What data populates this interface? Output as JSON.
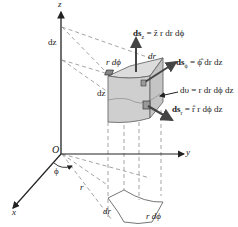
{
  "diagram": {
    "axes": {
      "z_label": "z",
      "y_label": "y",
      "x_label": "x",
      "origin_label": "O",
      "phi_label": "ϕ",
      "r_label": "r"
    },
    "labels": {
      "dz_axis": "dz",
      "dz_cube": "dz",
      "r_dphi_top": "r dϕ",
      "dr_top": "dr",
      "dr_base": "dr",
      "r_dphi_base": "r dϕ"
    },
    "equations": {
      "ds_z": "ds_z = ẑ r dr dϕ",
      "ds_phi": "ds_ϕ = ϕ̂ dr dz",
      "dv": "dυ = r dr dϕ dz",
      "ds_r": "ds_r = r̂ r dϕ dz"
    },
    "equation_parts": {
      "ds_z_lhs": "ds",
      "ds_z_sub": "z",
      "ds_z_rhs": " = ẑ r dr dϕ",
      "ds_phi_lhs": "ds",
      "ds_phi_sub": "ϕ",
      "ds_phi_rhs": " = ϕ̂ dr dz",
      "dv_text": "dυ = r dr dϕ dz",
      "ds_r_lhs": "ds",
      "ds_r_sub": "r",
      "ds_r_rhs": " = r̂ r dϕ dz"
    },
    "colors": {
      "axis": "#222222",
      "dashed": "#9a9a9a",
      "cube_fill": "#d4d4d4",
      "cube_edge": "#6a6a6a"
    }
  }
}
